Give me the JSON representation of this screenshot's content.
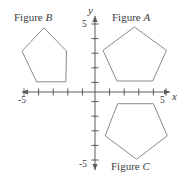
{
  "chart_data": {
    "type": "scatter",
    "title": "",
    "xlabel": "x",
    "ylabel": "y",
    "grid": false,
    "legend_position": "none",
    "xlim": [
      -5.5,
      5.5
    ],
    "ylim": [
      -5.5,
      5.5
    ],
    "x_tick_labels": [
      "-5",
      "5"
    ],
    "y_tick_labels": [
      "5",
      "-5"
    ],
    "x_ticks": [
      -5,
      -4,
      -3,
      -2,
      -1,
      1,
      2,
      3,
      4,
      5
    ],
    "y_ticks": [
      5,
      4,
      3,
      2,
      1,
      -1,
      -2,
      -3,
      -4,
      -5
    ],
    "axis_origin_px": [
      95,
      92
    ],
    "unit_px": 14.6,
    "shapes": [
      {
        "name": "Figure A",
        "letter": "A",
        "type": "pentagon",
        "orientation": "point-up",
        "center": [
          2.7,
          2.5
        ],
        "vertices": [
          [
            2.7,
            4.45
          ],
          [
            0.55,
            2.85
          ],
          [
            1.5,
            0.75
          ],
          [
            3.95,
            0.75
          ],
          [
            4.9,
            2.85
          ]
        ]
      },
      {
        "name": "Figure B",
        "letter": "B",
        "type": "pentagon",
        "orientation": "point-up",
        "center": [
          -3.5,
          2.45
        ],
        "vertices": [
          [
            -3.5,
            4.4
          ],
          [
            -5.0,
            2.8
          ],
          [
            -4.0,
            0.7
          ],
          [
            -2.0,
            0.7
          ],
          [
            -1.95,
            2.8
          ]
        ]
      },
      {
        "name": "Figure C",
        "letter": "C",
        "type": "pentagon",
        "orientation": "point-down",
        "center": [
          2.85,
          -2.6
        ],
        "vertices": [
          [
            2.85,
            -4.6
          ],
          [
            0.7,
            -3.0
          ],
          [
            1.55,
            -0.8
          ],
          [
            4.0,
            -0.8
          ],
          [
            4.95,
            -3.0
          ]
        ]
      }
    ]
  },
  "labels": {
    "figure_a_prefix": "Figure ",
    "figure_a_letter": "A",
    "figure_b_prefix": "Figure ",
    "figure_b_letter": "B",
    "figure_c_prefix": "Figure ",
    "figure_c_letter": "C",
    "axis_x_name": "x",
    "axis_y_name": "y",
    "x_neg5": "-5",
    "x_pos5": "5",
    "y_pos5": "5",
    "y_neg5": "-5"
  },
  "colors": {
    "background": "#ffffff",
    "axis": "#5b5b5b",
    "shape_stroke": "#8b8b8b",
    "text": "#3d3d3d"
  }
}
